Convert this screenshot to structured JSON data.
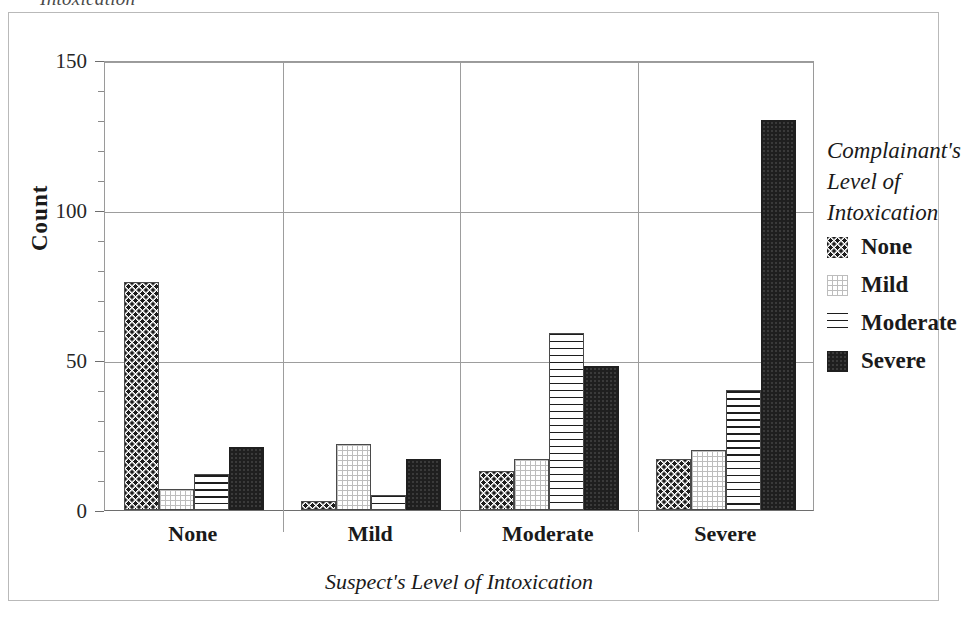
{
  "caption_remnant": "Intoxication",
  "chart_data": {
    "type": "bar",
    "title": "",
    "xlabel": "Suspect's Level of Intoxication",
    "ylabel": "Count",
    "categories": [
      "None",
      "Mild",
      "Moderate",
      "Severe"
    ],
    "series": [
      {
        "name": "None",
        "pattern": "dots",
        "values": [
          76,
          3,
          13,
          17
        ]
      },
      {
        "name": "Mild",
        "pattern": "fine-grid",
        "values": [
          7,
          22,
          17,
          20
        ]
      },
      {
        "name": "Moderate",
        "pattern": "horizontal-lines",
        "values": [
          12,
          5,
          59,
          40
        ]
      },
      {
        "name": "Severe",
        "pattern": "solid-black",
        "values": [
          21,
          17,
          48,
          130
        ]
      }
    ],
    "ylim": [
      0,
      150
    ],
    "y_major_ticks": [
      0,
      50,
      100,
      150
    ],
    "y_minor_tick_step": 10,
    "grid": true,
    "legend_position": "right",
    "legend_title": [
      "Complainant's",
      "Level of",
      "Intoxication"
    ],
    "legend_entries": [
      "None",
      "Mild",
      "Moderate",
      "Severe"
    ]
  },
  "axis": {
    "y_tick_labels": [
      "0",
      "50",
      "100",
      "150"
    ],
    "y_title": "Count",
    "x_title": "Suspect's Level of Intoxication",
    "x_group_labels": [
      "None",
      "Mild",
      "Moderate",
      "Severe"
    ]
  },
  "legend": {
    "title_lines": [
      "Complainant's",
      "Level of",
      "Intoxication"
    ],
    "items": [
      {
        "label": "None"
      },
      {
        "label": "Mild"
      },
      {
        "label": "Moderate"
      },
      {
        "label": "Severe"
      }
    ]
  }
}
